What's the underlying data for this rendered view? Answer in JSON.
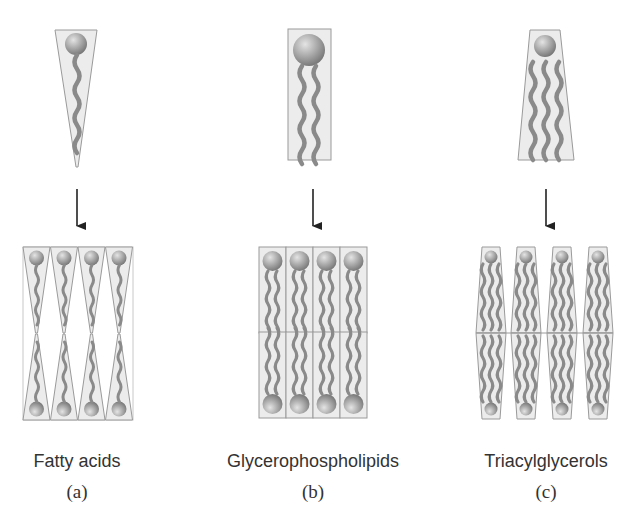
{
  "figure": {
    "panels": [
      {
        "id": "a",
        "name": "Fatty acids",
        "sublabel": "(a)",
        "monomer_shape": "inverted cone (one tail)",
        "aggregate": "alternating cones, head groups at top and bottom"
      },
      {
        "id": "b",
        "name": "Glycerophospholipids",
        "sublabel": "(b)",
        "monomer_shape": "cylinder (two tails)",
        "aggregate": "bilayer of cylinders"
      },
      {
        "id": "c",
        "name": "Triacylglycerols",
        "sublabel": "(c)",
        "monomer_shape": "truncated cone (three tails)",
        "aggregate": "bilayer of truncated cones"
      }
    ],
    "colors": {
      "shape_fill": "#ececec",
      "shape_stroke": "#9a9a9a",
      "head_light": "#d8d8d8",
      "head_dark": "#7d7d7d",
      "tail": "#8a8a8a",
      "arrow": "#222222",
      "text": "#333333"
    }
  }
}
